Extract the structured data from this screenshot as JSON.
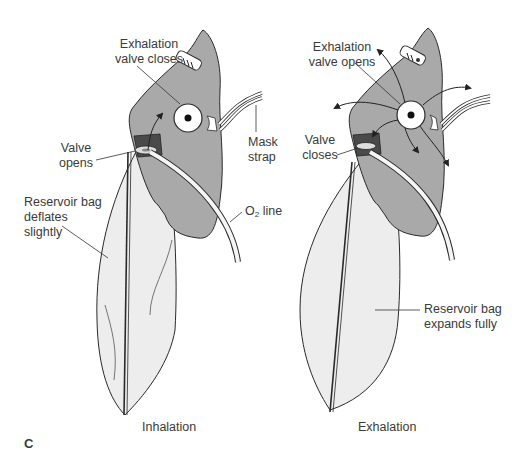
{
  "figure": {
    "panel_letter": "C",
    "colors": {
      "mask_fill": "#a9a9a9",
      "bag_fill": "#ececec",
      "outline": "#2a2a2a",
      "label_text": "#3a3a3a"
    },
    "left": {
      "caption": "Inhalation",
      "labels": {
        "exhalation_valve_line1": "Exhalation",
        "exhalation_valve_line2": "valve closes",
        "valve_line1": "Valve",
        "valve_line2": "opens",
        "bag_line1": "Reservoir bag",
        "bag_line2": "deflates",
        "bag_line3": "slightly",
        "strap_line1": "Mask",
        "strap_line2": "strap",
        "o2_prefix": "O",
        "o2_sub": "2",
        "o2_suffix": " line"
      }
    },
    "right": {
      "caption": "Exhalation",
      "labels": {
        "exhalation_valve_line1": "Exhalation",
        "exhalation_valve_line2": "valve opens",
        "valve_line1": "Valve",
        "valve_line2": "closes",
        "bag_line1": "Reservoir bag",
        "bag_line2": "expands fully"
      }
    }
  }
}
